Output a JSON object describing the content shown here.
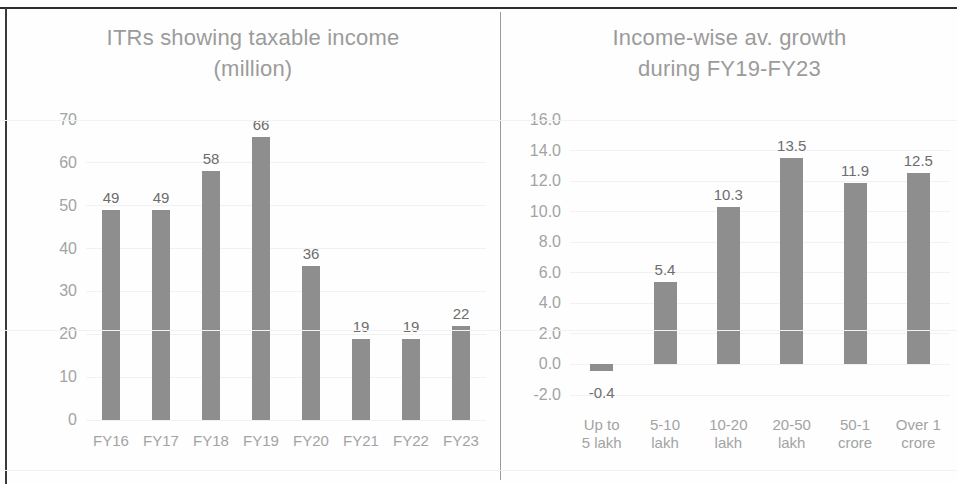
{
  "charts": [
    {
      "title": "ITRs showing taxable income\n(million)",
      "chart_data": {
        "type": "bar",
        "title": "ITRs showing taxable income (million)",
        "xlabel": "",
        "ylabel": "",
        "ylim": [
          0,
          70
        ],
        "ytick_step": 10,
        "yticks": [
          "0",
          "10",
          "20",
          "30",
          "40",
          "50",
          "60",
          "70"
        ],
        "grid": true,
        "legend": "none",
        "categories": [
          "FY16",
          "FY17",
          "FY18",
          "FY19",
          "FY20",
          "FY21",
          "FY22",
          "FY23"
        ],
        "values": [
          49,
          49,
          58,
          66,
          36,
          19,
          19,
          22
        ],
        "data_labels": [
          "49",
          "49",
          "58",
          "66",
          "36",
          "19",
          "19",
          "22"
        ]
      }
    },
    {
      "title": "Income-wise av. growth\nduring FY19-FY23",
      "chart_data": {
        "type": "bar",
        "title": "Income-wise av. growth during FY19-FY23",
        "xlabel": "",
        "ylabel": "",
        "ylim": [
          -2.0,
          16.0
        ],
        "ytick_step": 2.0,
        "yticks": [
          "-2.0",
          "0.0",
          "2.0",
          "4.0",
          "6.0",
          "8.0",
          "10.0",
          "12.0",
          "14.0",
          "16.0"
        ],
        "grid": true,
        "legend": "none",
        "categories": [
          "Up to\n5 lakh",
          "5-10\nlakh",
          "10-20\nlakh",
          "20-50\nlakh",
          "50-1\ncrore",
          "Over 1\ncrore"
        ],
        "values": [
          -0.4,
          5.4,
          10.3,
          13.5,
          11.9,
          12.5
        ],
        "data_labels": [
          "-0.4",
          "5.4",
          "10.3",
          "13.5",
          "11.9",
          "12.5"
        ]
      }
    }
  ],
  "colors": {
    "bar": "#8e8e8e",
    "title_text": "#9b9b9b",
    "tick_text": "#a3a3a3",
    "data_label_text": "#6d6d6d",
    "gridline": "#f1f1f1",
    "frame": "#2e2e2e",
    "divider": "#9a9a9a",
    "background": "#fefefe"
  }
}
